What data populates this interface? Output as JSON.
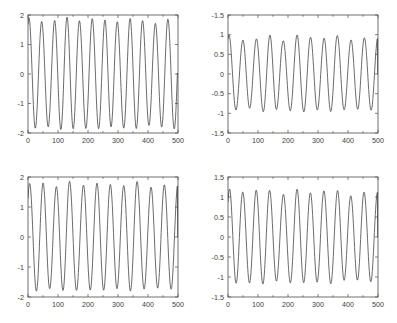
{
  "figure": {
    "background": "#ffffff",
    "line_color": "#3a3a3a",
    "axis_color": "#4d4d4d",
    "layout": "2x2 subplot grid"
  },
  "chart_data": [
    {
      "id": "top-left",
      "type": "line",
      "title": "",
      "xlabel": "",
      "ylabel": "",
      "xlim": [
        0,
        500
      ],
      "ylim": [
        -2,
        2
      ],
      "xticks": [
        0,
        100,
        200,
        300,
        400,
        500
      ],
      "xticklabels": [
        "0",
        "100",
        "200",
        "300",
        "400",
        "500"
      ],
      "yticks": [
        -2,
        -1,
        0,
        1,
        2
      ],
      "yticklabels": [
        "-2",
        "-1",
        "0",
        "1",
        "2"
      ],
      "grid": false,
      "legend": null,
      "series": [
        {
          "name": "signal",
          "description": "high-frequency oscillation, ~12 cycles over 500 samples, peak amplitude ~1.75 to 1.95, decaying to zero at the final sample",
          "period_samples": 42,
          "amplitude_envelope": [
            1.92,
            1.78,
            1.8,
            1.94,
            1.8,
            1.88,
            1.84,
            1.76,
            1.89,
            1.82,
            1.7,
            1.86
          ],
          "n_points": 500,
          "end_value": 0
        }
      ]
    },
    {
      "id": "top-right",
      "type": "line",
      "title": "",
      "xlabel": "",
      "ylabel": "",
      "xlim": [
        0,
        500
      ],
      "ylim": [
        -1.5,
        1.5
      ],
      "xticks": [
        0,
        100,
        200,
        300,
        400,
        500
      ],
      "xticklabels": [
        "0",
        "100",
        "200",
        "300",
        "400",
        "500"
      ],
      "yticks": [
        -1.5,
        -1,
        -0.5,
        0,
        0.5,
        1,
        1.5
      ],
      "yticklabels": [
        "-1.5",
        "-1",
        "-0.5",
        "0",
        "0.5",
        "1",
        "-1.5"
      ],
      "grid": false,
      "legend": null,
      "series": [
        {
          "name": "signal",
          "description": "oscillation with visible amplitude modulation, ~11 cycles over 500 samples, peaks between 0.80 and 1.05, decaying to zero at the final sample",
          "period_samples": 45,
          "amplitude_envelope": [
            1.0,
            0.86,
            0.88,
            1.01,
            0.83,
            1.0,
            0.94,
            0.9,
            0.99,
            0.86,
            0.92
          ],
          "n_points": 500,
          "end_value": 0
        }
      ]
    },
    {
      "id": "bottom-left",
      "type": "line",
      "title": "",
      "xlabel": "",
      "ylabel": "",
      "xlim": [
        0,
        500
      ],
      "ylim": [
        -2,
        2
      ],
      "xticks": [
        0,
        100,
        200,
        300,
        400,
        500
      ],
      "xticklabels": [
        "0",
        "100",
        "200",
        "300",
        "400",
        "500"
      ],
      "yticks": [
        -2,
        -1,
        0,
        1,
        2
      ],
      "yticklabels": [
        "-2",
        "-1",
        "0",
        "1",
        "2"
      ],
      "grid": false,
      "legend": null,
      "series": [
        {
          "name": "signal",
          "description": "high-frequency oscillation, ~11 cycles over 500 samples, peak amplitude ~1.60 to 1.90, decaying to zero at the final sample",
          "period_samples": 45,
          "amplitude_envelope": [
            1.78,
            1.82,
            1.66,
            1.87,
            1.72,
            1.8,
            1.76,
            1.7,
            1.87,
            1.65,
            1.74
          ],
          "n_points": 500,
          "end_value": 0
        }
      ]
    },
    {
      "id": "bottom-right",
      "type": "line",
      "title": "",
      "xlabel": "",
      "ylabel": "",
      "xlim": [
        0,
        500
      ],
      "ylim": [
        -1.5,
        1.5
      ],
      "xticks": [
        0,
        100,
        200,
        300,
        400,
        500
      ],
      "xticklabels": [
        "0",
        "100",
        "200",
        "300",
        "400",
        "500"
      ],
      "yticks": [
        -1.5,
        -1,
        -0.5,
        0,
        0.5,
        1,
        1.5
      ],
      "yticklabels": [
        "-1.5",
        "-1",
        "-0.5",
        "0",
        "0.5",
        "1",
        "1.5"
      ],
      "grid": false,
      "legend": null,
      "series": [
        {
          "name": "signal",
          "description": "oscillation with amplitude modulation, ~11 cycles over 500 samples, peaks between 1.00 and 1.25, decaying to zero at the final sample",
          "period_samples": 45,
          "amplitude_envelope": [
            1.21,
            1.12,
            1.17,
            1.18,
            1.05,
            1.21,
            1.1,
            1.15,
            1.18,
            1.02,
            1.12
          ],
          "n_points": 500,
          "end_value": 0
        }
      ]
    }
  ]
}
